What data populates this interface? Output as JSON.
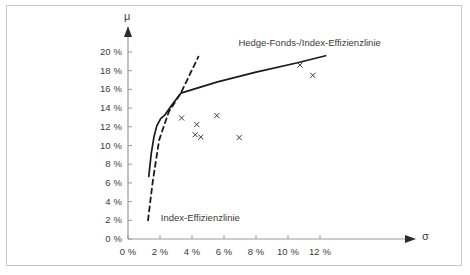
{
  "chart_data": {
    "type": "line",
    "title": "",
    "xlabel": "σ",
    "ylabel": "μ",
    "xlim": [
      0,
      13.2
    ],
    "ylim": [
      0,
      21.2
    ],
    "grid": false,
    "legend_position": "inline-annotations",
    "x_ticks": [
      "0 %",
      "2 %",
      "4 %",
      "6 %",
      "8 %",
      "10 %",
      "12 %"
    ],
    "x_tick_values": [
      0,
      2,
      4,
      6,
      8,
      10,
      12
    ],
    "y_ticks": [
      "0 %",
      "2 %",
      "4 %",
      "6 %",
      "8 %",
      "10 %",
      "12 %",
      "14 %",
      "16 %",
      "18 %",
      "20 %"
    ],
    "y_tick_values": [
      0,
      2,
      4,
      6,
      8,
      10,
      12,
      14,
      16,
      18,
      20
    ],
    "annotations": [
      {
        "name": "hedge-fonds-index-efficiency-line-label",
        "text": "Hedge-Fonds-/Index-Effizienzlinie",
        "x": 6.9,
        "y": 20.9
      },
      {
        "name": "index-efficiency-line-label",
        "text": "Index-Effizienzlinie",
        "x": 2.05,
        "y": 2.1
      }
    ],
    "series": [
      {
        "name": "Hedge-Fonds-/Index-Effizienzlinie",
        "style": "solid",
        "color": "#1a1a1a",
        "points": [
          [
            1.3,
            6.7
          ],
          [
            1.45,
            9.1
          ],
          [
            1.62,
            10.9
          ],
          [
            1.8,
            12.1
          ],
          [
            2.05,
            12.9
          ],
          [
            2.3,
            13.25
          ],
          [
            2.75,
            14.35
          ],
          [
            3.3,
            15.6
          ],
          [
            5.6,
            16.8
          ],
          [
            8.0,
            17.85
          ],
          [
            10.6,
            18.85
          ],
          [
            12.35,
            19.6
          ]
        ]
      },
      {
        "name": "Index-Effizienzlinie",
        "style": "dashed",
        "color": "#1a1a1a",
        "points": [
          [
            1.25,
            2.0
          ],
          [
            1.55,
            6.2
          ],
          [
            1.95,
            10.6
          ],
          [
            2.55,
            13.6
          ],
          [
            3.3,
            15.6
          ],
          [
            4.4,
            19.5
          ]
        ]
      }
    ],
    "scatter": {
      "name": "Hedge-Fonds / Indizes",
      "marker": "x",
      "color": "#3a3a3a",
      "points": [
        [
          3.35,
          12.95
        ],
        [
          4.3,
          12.25
        ],
        [
          4.2,
          11.15
        ],
        [
          4.55,
          10.9
        ],
        [
          5.55,
          13.2
        ],
        [
          6.95,
          10.85
        ],
        [
          10.75,
          18.6
        ],
        [
          11.55,
          17.5
        ]
      ]
    }
  }
}
